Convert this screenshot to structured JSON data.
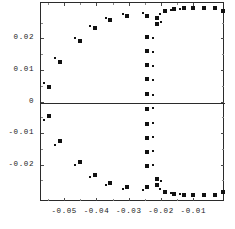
{
  "chart_data": {
    "type": "scatter",
    "title": "",
    "subtitle": "",
    "xlabel": "",
    "ylabel": "",
    "xlim": [
      -0.0575,
      -0.0005
    ],
    "ylim": [
      -0.0315,
      0.0315
    ],
    "grid": false,
    "legend": null,
    "xticks": [
      -0.05,
      -0.04,
      -0.03,
      -0.02,
      -0.01
    ],
    "xticklabels": [
      "-0.05",
      "-0.04",
      "-0.03",
      "-0.02",
      "-0.01"
    ],
    "yticks": [
      0.02,
      0.01,
      0,
      -0.01,
      -0.02
    ],
    "yticklabels": [
      "0.02",
      "0.01",
      "0",
      "-0.01",
      "-0.02"
    ],
    "x_minor_ticks": [
      -0.055,
      -0.045,
      -0.035,
      -0.025,
      -0.015,
      -0.005
    ],
    "y_minor_ticks": [
      0.025,
      0.015,
      0.005,
      -0.005,
      -0.015,
      -0.025
    ],
    "zero_line_y": 0,
    "marker_color": "#111111",
    "frame_color": "#2b2b2b",
    "series": [
      {
        "name": "large-markers",
        "marker": "square",
        "size": 4,
        "points": [
          [
            -0.0547,
            0.0047
          ],
          [
            -0.0512,
            0.0125
          ],
          [
            -0.0452,
            0.019
          ],
          [
            -0.0405,
            0.0232
          ],
          [
            -0.0358,
            0.0258
          ],
          [
            -0.0305,
            0.0272
          ],
          [
            -0.0242,
            0.0272
          ],
          [
            -0.0213,
            0.0265
          ],
          [
            -0.0213,
            0.0245
          ],
          [
            -0.0242,
            0.0205
          ],
          [
            -0.0242,
            0.016
          ],
          [
            -0.0242,
            0.0115
          ],
          [
            -0.0242,
            0.007
          ],
          [
            -0.0242,
            0.0025
          ],
          [
            -0.0242,
            -0.0025
          ],
          [
            -0.0242,
            -0.007
          ],
          [
            -0.0242,
            -0.0115
          ],
          [
            -0.0242,
            -0.016
          ],
          [
            -0.0242,
            -0.0205
          ],
          [
            -0.0213,
            -0.0245
          ],
          [
            -0.0213,
            -0.0265
          ],
          [
            -0.0242,
            -0.0272
          ],
          [
            -0.0305,
            -0.0272
          ],
          [
            -0.0358,
            -0.0258
          ],
          [
            -0.0405,
            -0.0232
          ],
          [
            -0.0452,
            -0.019
          ],
          [
            -0.0512,
            -0.0125
          ],
          [
            -0.0547,
            -0.0047
          ],
          [
            -0.0188,
            0.0285
          ],
          [
            -0.016,
            0.0292
          ],
          [
            -0.013,
            0.0295
          ],
          [
            -0.01,
            0.0297
          ],
          [
            -0.0068,
            0.0297
          ],
          [
            -0.0032,
            0.0295
          ],
          [
            -0.0009,
            0.0288
          ],
          [
            -0.0188,
            -0.0285
          ],
          [
            -0.016,
            -0.0292
          ],
          [
            -0.013,
            -0.0295
          ],
          [
            -0.01,
            -0.0297
          ],
          [
            -0.0068,
            -0.0297
          ],
          [
            -0.0032,
            -0.0295
          ],
          [
            -0.0009,
            -0.0288
          ]
        ]
      },
      {
        "name": "small-markers",
        "marker": "square",
        "size": 2,
        "points": [
          [
            -0.0562,
            0.006
          ],
          [
            -0.0527,
            0.0138
          ],
          [
            -0.0468,
            0.02
          ],
          [
            -0.042,
            0.024
          ],
          [
            -0.0372,
            0.0263
          ],
          [
            -0.0318,
            0.0277
          ],
          [
            -0.0255,
            0.028
          ],
          [
            -0.0202,
            0.0277
          ],
          [
            -0.0199,
            0.0252
          ],
          [
            -0.0224,
            0.02
          ],
          [
            -0.0224,
            0.0157
          ],
          [
            -0.0224,
            0.0112
          ],
          [
            -0.0224,
            0.0067
          ],
          [
            -0.0224,
            0.0022
          ],
          [
            -0.0224,
            -0.0022
          ],
          [
            -0.0224,
            -0.0067
          ],
          [
            -0.0224,
            -0.0112
          ],
          [
            -0.0224,
            -0.0157
          ],
          [
            -0.0224,
            -0.02
          ],
          [
            -0.0199,
            -0.0252
          ],
          [
            -0.0202,
            -0.0277
          ],
          [
            -0.0255,
            -0.028
          ],
          [
            -0.0318,
            -0.0277
          ],
          [
            -0.0372,
            -0.0263
          ],
          [
            -0.042,
            -0.024
          ],
          [
            -0.0468,
            -0.02
          ],
          [
            -0.0527,
            -0.0138
          ],
          [
            -0.0562,
            -0.006
          ],
          [
            -0.017,
            0.029
          ],
          [
            -0.014,
            0.0294
          ],
          [
            -0.017,
            -0.029
          ],
          [
            -0.014,
            -0.0294
          ]
        ]
      }
    ]
  },
  "geometry": {
    "frame": {
      "left": 40,
      "top": 2,
      "width": 184,
      "height": 199
    }
  }
}
